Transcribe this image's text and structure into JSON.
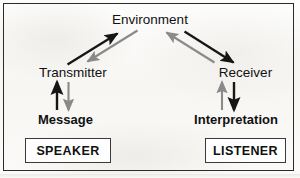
{
  "diagram": {
    "colors": {
      "primary_arrow": "#161616",
      "secondary_arrow": "#8a8a8a",
      "text": "#111111",
      "frame": "#2b2b2b",
      "box_border": "#3a3a3a",
      "background": "#fbfbfa"
    },
    "nodes": {
      "environment": "Environment",
      "transmitter": "Transmitter",
      "receiver": "Receiver",
      "message": "Message",
      "interpretation": "Interpretation"
    },
    "role_boxes": {
      "speaker": "SPEAKER",
      "listener": "LISTENER"
    },
    "arrows": [
      {
        "id": "transmitter-to-environment",
        "from": "Transmitter",
        "to": "Environment",
        "color": "#161616",
        "style": "solid",
        "direction": "up-right"
      },
      {
        "id": "environment-to-transmitter",
        "from": "Environment",
        "to": "Transmitter",
        "color": "#8a8a8a",
        "style": "solid",
        "direction": "down-left"
      },
      {
        "id": "receiver-to-environment",
        "from": "Receiver",
        "to": "Environment",
        "color": "#8a8a8a",
        "style": "solid",
        "direction": "up-left"
      },
      {
        "id": "environment-to-receiver",
        "from": "Environment",
        "to": "Receiver",
        "color": "#161616",
        "style": "solid",
        "direction": "down-right"
      },
      {
        "id": "message-to-transmitter",
        "from": "Message",
        "to": "Transmitter",
        "color": "#161616",
        "style": "solid",
        "direction": "up"
      },
      {
        "id": "transmitter-to-message",
        "from": "Transmitter",
        "to": "Message",
        "color": "#8a8a8a",
        "style": "solid",
        "direction": "down"
      },
      {
        "id": "interpretation-to-receiver",
        "from": "Interpretation",
        "to": "Receiver",
        "color": "#8a8a8a",
        "style": "solid",
        "direction": "up"
      },
      {
        "id": "receiver-to-interpretation",
        "from": "Receiver",
        "to": "Interpretation",
        "color": "#161616",
        "style": "solid",
        "direction": "down"
      }
    ]
  }
}
